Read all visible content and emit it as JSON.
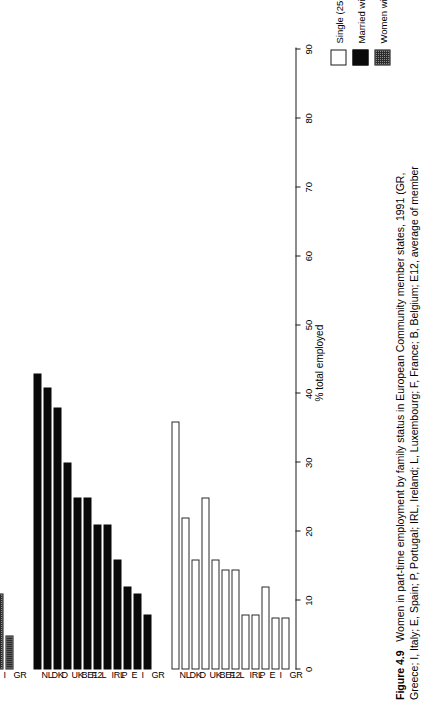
{
  "figure": {
    "number": "Figure 4.9",
    "caption_line1": "Women in part-time employment by family status in European Community member states, 1991 (GR,",
    "caption_line2": "Greece; I, Italy; E, Spain; P, Portugal; IRL, Ireland; L, Luxembourg; F, France; B, Belgium; E12, average of member"
  },
  "legend": {
    "position": "top-left",
    "entries": [
      {
        "label": "Single (25+) without children",
        "swatch": "white-open-square",
        "color": "#ffffff"
      },
      {
        "label": "Married without children",
        "swatch": "black-filled-square",
        "color": "#0a0a0a"
      },
      {
        "label": "Women with children",
        "swatch": "grey-hatched-square",
        "color": "#8c8c8c"
      }
    ]
  },
  "chart_data": {
    "type": "bar",
    "orientation": "horizontal-rotated",
    "title": "Women in part-time employment by family status in European Community member states, 1991",
    "xlabel": "",
    "ylabel": "% total employed",
    "ylim": [
      0,
      90
    ],
    "ytick_values": [
      0,
      10,
      20,
      30,
      40,
      50,
      60,
      70,
      80,
      90
    ],
    "ytick_labels": [
      "0",
      "10",
      "20",
      "30",
      "40",
      "50",
      "60",
      "70",
      "80",
      "90"
    ],
    "grid": false,
    "categories": [
      "GR",
      "I",
      "E",
      "P",
      "IRL",
      "L",
      "F",
      "BE12",
      "UK",
      "D",
      "DK",
      "NL"
    ],
    "series": [
      {
        "name": "Single (25+) without children",
        "color": "#ffffff",
        "values": [
          7.5,
          7.5,
          12,
          8,
          8,
          14.5,
          14.5,
          16,
          25,
          16,
          22,
          36
        ]
      },
      {
        "name": "Married without children",
        "color": "#0a0a0a",
        "values": [
          8,
          11,
          12,
          16,
          21,
          21,
          25,
          25,
          30,
          38,
          41,
          43
        ]
      },
      {
        "name": "Women with children",
        "color": "#8c8c8c",
        "values": [
          5,
          11,
          13,
          8,
          31,
          31,
          27,
          35,
          40,
          63,
          57,
          36
        ]
      }
    ],
    "series_extra_note": "third group also includes a final NL bar of 85"
  },
  "axis": {
    "y_title": "% total employed"
  }
}
